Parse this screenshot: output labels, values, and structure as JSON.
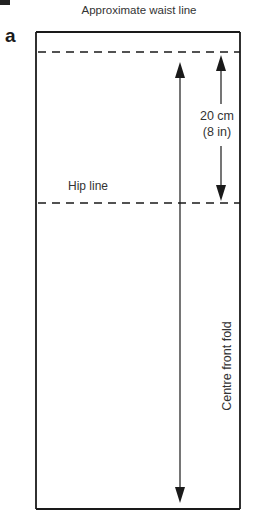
{
  "figure": {
    "letter": "a",
    "title": "Approximate waist line",
    "labels": {
      "hip_line": "Hip line",
      "measurement_cm": "20 cm",
      "measurement_in": "(8 in)",
      "fold": "Centre front fold"
    },
    "colors": {
      "ink": "#1a1a1a",
      "background": "#ffffff"
    }
  }
}
